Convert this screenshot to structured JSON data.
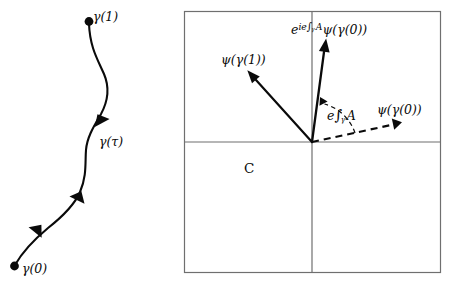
{
  "figure": {
    "type": "mathematical-diagram",
    "left_panel": {
      "name": "path-diagram",
      "curve_label_start": "γ(0)",
      "curve_label_mid": "γ(τ)",
      "curve_label_end": "γ(1)",
      "endpoint_markers": 2,
      "direction_arrowheads": 3
    },
    "right_panel": {
      "name": "complex-plane-diagram",
      "plane_label": "C",
      "axes": {
        "horizontal": "real-axis",
        "vertical": "imaginary-axis"
      },
      "vectors": [
        {
          "name": "psi-gamma-1-vector",
          "label": "ψ(γ(1))",
          "style": "solid",
          "direction": "upper-left"
        },
        {
          "name": "phase-rotated-psi-vector",
          "label_parts": {
            "base": "e",
            "exponent": "ie∫_γ A",
            "operand": "ψ(γ(0))"
          },
          "label": "e^{ie∫_γ A}ψ(γ(0))",
          "style": "solid",
          "direction": "up"
        },
        {
          "name": "psi-gamma-0-vector",
          "label": "ψ(γ(0))",
          "style": "dashed",
          "direction": "right-slightly-up"
        }
      ],
      "angle_arc": {
        "name": "phase-angle-arc",
        "label": "e∫_γ A",
        "between": [
          "psi-gamma-0-vector",
          "phase-rotated-psi-vector"
        ]
      }
    }
  },
  "labels": {
    "gamma_1": "γ(1)",
    "gamma_tau": "γ(τ)",
    "gamma_0": "γ(0)",
    "psi_gamma_1": "ψ(γ(1))",
    "psi_gamma_0": "ψ(γ(0))",
    "complex_plane": "C",
    "phase_e": "e",
    "phase_i_e": "ie",
    "integral": "∫",
    "gamma_sub": "γ",
    "connection_A": "A",
    "psi_of_gamma_0": "ψ(γ(0))"
  },
  "colors": {
    "ink": "#0a0a0a",
    "frame": "#6f6f6f",
    "axis": "#6f6f6f",
    "background": "#ffffff"
  }
}
